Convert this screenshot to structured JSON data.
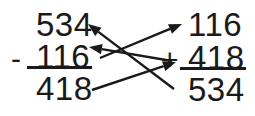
{
  "figure": {
    "caption": "Subtraction problem checked by addition, with arrows mapping each term",
    "ink_color": "#1a1a1a",
    "background_color": "#ffffff",
    "width": 255,
    "height": 116
  },
  "subtraction": {
    "name": "subtraction-problem",
    "minuend": "534",
    "operator": "-",
    "subtrahend": "116",
    "difference": "418",
    "rule_label": "subtraction-bar"
  },
  "addition": {
    "name": "addition-check",
    "addend_top": "116",
    "operator": "+",
    "addend_bottom": "418",
    "sum": "534",
    "rule_label": "addition-bar"
  },
  "arrows": [
    {
      "name": "arrow-sum-to-minuend",
      "from": "addition.sum",
      "to": "subtraction.minuend",
      "x1": 174,
      "y1": 89,
      "x2": 88,
      "y2": 24
    },
    {
      "name": "arrow-addend-bottom-to-subtrahend",
      "from": "addition.addend_bottom",
      "to": "subtraction.subtrahend",
      "x1": 172,
      "y1": 61,
      "x2": 89,
      "y2": 47
    },
    {
      "name": "arrow-subtrahend-to-addend-top",
      "from": "subtraction.subtrahend",
      "to": "addition.addend_top",
      "x1": 100,
      "y1": 58,
      "x2": 182,
      "y2": 24
    },
    {
      "name": "arrow-difference-to-addend-bottom",
      "from": "subtraction.difference",
      "to": "addition.addend_bottom",
      "x1": 92,
      "y1": 90,
      "x2": 176,
      "y2": 62
    }
  ]
}
